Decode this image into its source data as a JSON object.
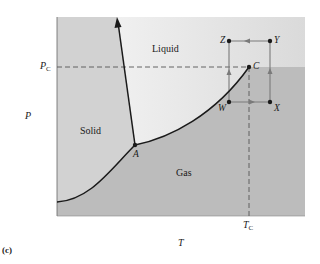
{
  "figure": {
    "caption": "(c)",
    "axes": {
      "x_label": "T",
      "y_label": "P",
      "critical_temperature_label": {
        "main": "T",
        "sub": "C"
      },
      "critical_pressure_label": {
        "main": "P",
        "sub": "C"
      }
    },
    "regions": {
      "solid": "Solid",
      "liquid": "Liquid",
      "gas": "Gas"
    },
    "points": {
      "triple_point": "A",
      "critical_point": "C",
      "W": "W",
      "X": "X",
      "Y": "Y",
      "Z": "Z"
    },
    "path": {
      "description": "Cycle W → X → Y → Z → W around critical point",
      "order": [
        "W",
        "X",
        "Y",
        "Z",
        "W"
      ]
    },
    "colors": {
      "solid_region": "#d4d4d4",
      "liquid_region": "#ececec",
      "gas_region": "#bdbdbd",
      "curve": "#1a1a1a",
      "path_line": "#7a7a7a",
      "dashed": "#555555"
    }
  }
}
